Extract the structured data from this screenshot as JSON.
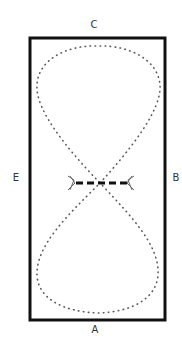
{
  "diagram": {
    "type": "arena-figure-eight",
    "markers": {
      "top": "C",
      "bottom": "A",
      "left": "E",
      "right": "B"
    },
    "center_obstacle": "pole-with-jump-wings",
    "path_style": "dotted",
    "colors": {
      "border": "#111111",
      "path": "#555555",
      "label": "#333333"
    }
  }
}
